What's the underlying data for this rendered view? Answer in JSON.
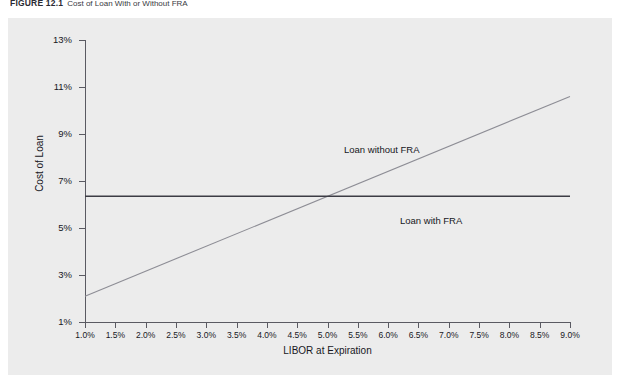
{
  "figure": {
    "number": "FIGURE 12.1",
    "title": "Cost of Loan With or Without FRA"
  },
  "chart_data": {
    "type": "line",
    "title": "Cost of Loan With or Without FRA",
    "xlabel": "LIBOR at Expiration",
    "ylabel": "Cost of Loan",
    "xlim": [
      1.0,
      9.0
    ],
    "ylim": [
      1,
      13
    ],
    "grid": false,
    "legend_position": "inline-annotation",
    "x_tick_labels": [
      "1.0%",
      "1.5%",
      "2.0%",
      "2.5%",
      "3.0%",
      "3.5%",
      "4.0%",
      "4.5%",
      "5.0%",
      "5.5%",
      "6.0%",
      "6.5%",
      "7.0%",
      "7.5%",
      "8.0%",
      "8.5%",
      "9.0%"
    ],
    "x_tick_values": [
      1.0,
      1.5,
      2.0,
      2.5,
      3.0,
      3.5,
      4.0,
      4.5,
      5.0,
      5.5,
      6.0,
      6.5,
      7.0,
      7.5,
      8.0,
      8.5,
      9.0
    ],
    "y_tick_labels": [
      "1%",
      "3%",
      "5%",
      "7%",
      "9%",
      "11%",
      "13%"
    ],
    "y_tick_values": [
      1,
      3,
      5,
      7,
      9,
      11,
      13
    ],
    "series": [
      {
        "name": "Loan without FRA",
        "color": "#8d8d95",
        "x": [
          1.0,
          9.0
        ],
        "values": [
          2.1,
          10.6
        ]
      },
      {
        "name": "Loan with FRA",
        "color": "#3c3c44",
        "x": [
          1.0,
          9.0
        ],
        "values": [
          6.35,
          6.35
        ]
      }
    ],
    "annotations": [
      {
        "text": "Loan without FRA",
        "x": 6.3,
        "y": 8.6
      },
      {
        "text": "Loan with FRA",
        "x": 7.9,
        "y": 5.9
      }
    ]
  },
  "colors": {
    "panel": "#ececec",
    "axis": "#5a5a62",
    "without_fra_line": "#8d8d95",
    "with_fra_line": "#3c3c44",
    "text": "#17171d"
  }
}
